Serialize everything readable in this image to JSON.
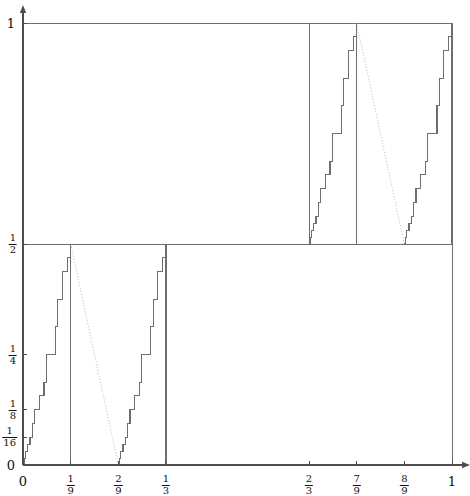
{
  "figure": {
    "background": "#ffffff",
    "axis_color": "#4d4d4d",
    "curve_color": "#6e6e6e",
    "dotted_color": "#b9b9b9",
    "frame_color": "#6e6e6e"
  },
  "axes": {
    "x_ticks": [
      {
        "label": "0",
        "value": 0,
        "kind": "plain"
      },
      {
        "label": "1/9",
        "num": "1",
        "den": "9",
        "value": 0.111111,
        "kind": "frac"
      },
      {
        "label": "2/9",
        "num": "2",
        "den": "9",
        "value": 0.222222,
        "kind": "frac"
      },
      {
        "label": "1/3",
        "num": "1",
        "den": "3",
        "value": 0.333333,
        "kind": "frac"
      },
      {
        "label": "2/3",
        "num": "2",
        "den": "3",
        "value": 0.666667,
        "kind": "frac"
      },
      {
        "label": "7/9",
        "num": "7",
        "den": "9",
        "value": 0.777778,
        "kind": "frac"
      },
      {
        "label": "8/9",
        "num": "8",
        "den": "9",
        "value": 0.888889,
        "kind": "frac"
      },
      {
        "label": "1",
        "value": 1,
        "kind": "plain"
      }
    ],
    "y_ticks": [
      {
        "label": "0",
        "value": 0,
        "kind": "plain"
      },
      {
        "label": "1/16",
        "num": "1",
        "den": "16",
        "value": 0.0625,
        "kind": "frac"
      },
      {
        "label": "1/8",
        "num": "1",
        "den": "8",
        "value": 0.125,
        "kind": "frac"
      },
      {
        "label": "1/4",
        "num": "1",
        "den": "4",
        "value": 0.25,
        "kind": "frac"
      },
      {
        "label": "1/2",
        "num": "1",
        "den": "2",
        "value": 0.5,
        "kind": "frac"
      },
      {
        "label": "1",
        "value": 1,
        "kind": "plain"
      }
    ],
    "xlim": [
      0,
      1
    ],
    "ylim": [
      0,
      1
    ],
    "x_arrow": true,
    "y_arrow": true
  },
  "chart_data": {
    "type": "line",
    "title": "",
    "xlabel": "",
    "ylabel": "",
    "xlim": [
      0,
      1
    ],
    "ylim": [
      0,
      1
    ],
    "grid": false,
    "legend": "none",
    "frames": [
      {
        "name": "lower-left-frame",
        "x0": 0,
        "x1": 0.333333,
        "y0": 0,
        "y1": 0.5
      },
      {
        "name": "upper-right-frame",
        "x0": 0.666667,
        "x1": 1,
        "y0": 0.5,
        "y1": 1
      }
    ],
    "outer_frame": {
      "x0": 0,
      "x1": 1,
      "y0": 0,
      "y1": 1
    },
    "dotted_diagonals": [
      {
        "name": "lower-left-diagonal",
        "x_start": 0.111111,
        "y_start": 0.5,
        "x_end": 0.222222,
        "y_end": 0
      },
      {
        "name": "upper-right-diagonal",
        "x_start": 0.777778,
        "y_start": 1.0,
        "x_end": 0.888889,
        "y_end": 0.5
      }
    ],
    "staircases": [
      {
        "name": "stair-A-rising",
        "x_from": 0,
        "x_to": 0.111111,
        "y_from": 0,
        "y_to": 0.5,
        "direction": "rising",
        "steps": [
          {
            "x": 0.0,
            "y": 0.0
          },
          {
            "x": 0.00271,
            "y": 0.01563
          },
          {
            "x": 0.00543,
            "y": 0.03125
          },
          {
            "x": 0.01086,
            "y": 0.04688
          },
          {
            "x": 0.01629,
            "y": 0.0625
          },
          {
            "x": 0.02172,
            "y": 0.09375
          },
          {
            "x": 0.02715,
            "y": 0.125
          },
          {
            "x": 0.03801,
            "y": 0.15625
          },
          {
            "x": 0.04887,
            "y": 0.1875
          },
          {
            "x": 0.0543,
            "y": 0.25
          },
          {
            "x": 0.07602,
            "y": 0.3125
          },
          {
            "x": 0.08145,
            "y": 0.375
          },
          {
            "x": 0.09231,
            "y": 0.4375
          },
          {
            "x": 0.10317,
            "y": 0.46875
          },
          {
            "x": 0.11111,
            "y": 0.5
          }
        ]
      },
      {
        "name": "stair-B-rising",
        "x_from": 0.222222,
        "x_to": 0.333333,
        "y_from": 0,
        "y_to": 0.5,
        "direction": "rising",
        "steps": [
          {
            "x": 0.22222,
            "y": 0.0
          },
          {
            "x": 0.22493,
            "y": 0.01563
          },
          {
            "x": 0.22765,
            "y": 0.03125
          },
          {
            "x": 0.23308,
            "y": 0.04688
          },
          {
            "x": 0.23851,
            "y": 0.0625
          },
          {
            "x": 0.24394,
            "y": 0.09375
          },
          {
            "x": 0.24937,
            "y": 0.125
          },
          {
            "x": 0.26023,
            "y": 0.15625
          },
          {
            "x": 0.27109,
            "y": 0.1875
          },
          {
            "x": 0.27652,
            "y": 0.25
          },
          {
            "x": 0.29824,
            "y": 0.3125
          },
          {
            "x": 0.30367,
            "y": 0.375
          },
          {
            "x": 0.31453,
            "y": 0.4375
          },
          {
            "x": 0.32539,
            "y": 0.46875
          },
          {
            "x": 0.33333,
            "y": 0.5
          }
        ]
      },
      {
        "name": "stair-C-rising",
        "x_from": 0.666667,
        "x_to": 0.777778,
        "y_from": 0.5,
        "y_to": 1.0,
        "direction": "rising",
        "steps": [
          {
            "x": 0.66667,
            "y": 0.5
          },
          {
            "x": 0.66938,
            "y": 0.51563
          },
          {
            "x": 0.6721,
            "y": 0.53125
          },
          {
            "x": 0.67753,
            "y": 0.54688
          },
          {
            "x": 0.68296,
            "y": 0.5625
          },
          {
            "x": 0.68839,
            "y": 0.59375
          },
          {
            "x": 0.69382,
            "y": 0.625
          },
          {
            "x": 0.70468,
            "y": 0.65625
          },
          {
            "x": 0.71554,
            "y": 0.6875
          },
          {
            "x": 0.72097,
            "y": 0.75
          },
          {
            "x": 0.74269,
            "y": 0.8125
          },
          {
            "x": 0.74812,
            "y": 0.875
          },
          {
            "x": 0.75898,
            "y": 0.9375
          },
          {
            "x": 0.76984,
            "y": 0.96875
          },
          {
            "x": 0.77778,
            "y": 1.0
          }
        ]
      },
      {
        "name": "stair-D-rising",
        "x_from": 0.888889,
        "x_to": 1.0,
        "y_from": 0.5,
        "y_to": 1.0,
        "direction": "rising",
        "steps": [
          {
            "x": 0.88889,
            "y": 0.5
          },
          {
            "x": 0.8916,
            "y": 0.51563
          },
          {
            "x": 0.89432,
            "y": 0.53125
          },
          {
            "x": 0.89975,
            "y": 0.54688
          },
          {
            "x": 0.90518,
            "y": 0.5625
          },
          {
            "x": 0.91061,
            "y": 0.59375
          },
          {
            "x": 0.91604,
            "y": 0.625
          },
          {
            "x": 0.9269,
            "y": 0.65625
          },
          {
            "x": 0.93776,
            "y": 0.6875
          },
          {
            "x": 0.94319,
            "y": 0.75
          },
          {
            "x": 0.96491,
            "y": 0.8125
          },
          {
            "x": 0.97034,
            "y": 0.875
          },
          {
            "x": 0.9812,
            "y": 0.9375
          },
          {
            "x": 0.99206,
            "y": 0.96875
          },
          {
            "x": 1.0,
            "y": 1.0
          }
        ]
      }
    ],
    "vertical_drops": [
      {
        "name": "drop-at-1/9",
        "x": 0.111111,
        "y_top": 0.5,
        "y_bottom": 0.0
      },
      {
        "name": "drop-at-1/3",
        "x": 0.333333,
        "y_top": 0.5,
        "y_bottom": 0.0
      },
      {
        "name": "drop-at-7/9",
        "x": 0.777778,
        "y_top": 1.0,
        "y_bottom": 0.5
      },
      {
        "name": "drop-at-1",
        "x": 1.0,
        "y_top": 1.0,
        "y_bottom": 0.5
      }
    ]
  }
}
